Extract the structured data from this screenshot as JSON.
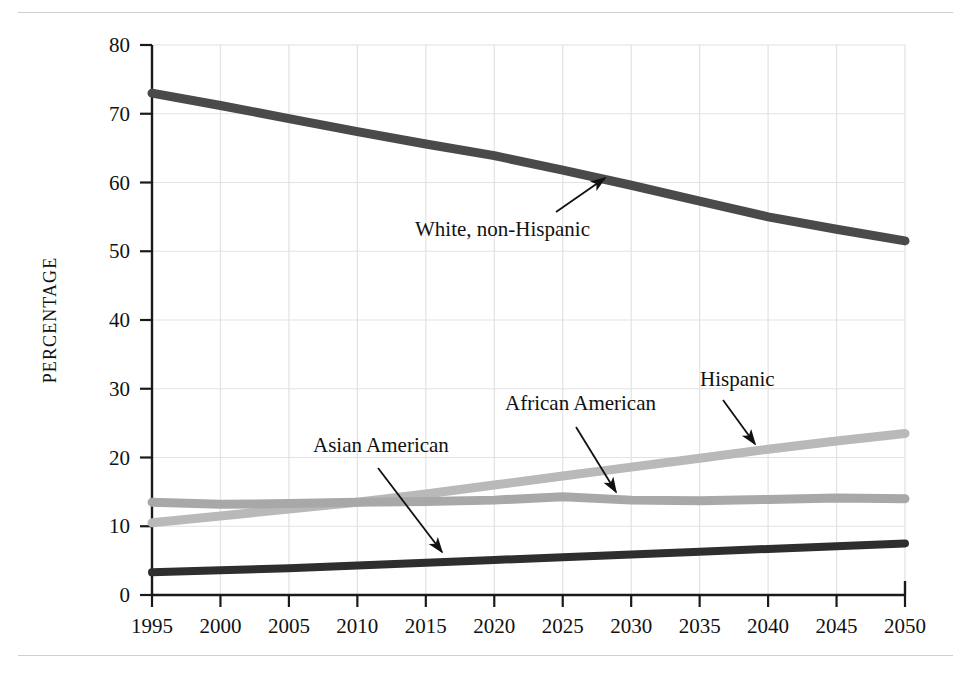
{
  "figure": {
    "top_rule": "horizontal-rule",
    "bottom_rule": "horizontal-rule"
  },
  "axes": {
    "y_title": "PERCENTAGE",
    "y_ticks": [
      "0",
      "10",
      "20",
      "30",
      "40",
      "50",
      "60",
      "70",
      "80"
    ],
    "x_ticks": [
      "1995",
      "2000",
      "2005",
      "2010",
      "2015",
      "2020",
      "2025",
      "2030",
      "2035",
      "2040",
      "2045",
      "2050"
    ]
  },
  "colors": {
    "white_non_hispanic": "#4a4a4a",
    "hispanic": "#b9b9b9",
    "african_american": "#a8a8a8",
    "asian_american": "#2e2e2e",
    "grid": "#e2e2e2",
    "axis": "#1a1a1a",
    "rule": "#cfcfcf",
    "text": "#111111"
  },
  "annotations": [
    {
      "id": "white-non-hispanic",
      "label": "White, non-Hispanic",
      "text_x": 415,
      "text_y": 236,
      "arrow_from_x": 556,
      "arrow_from_y": 212,
      "arrow_to_x": 605,
      "arrow_to_y": 178
    },
    {
      "id": "asian-american",
      "label": "Asian American",
      "text_x": 313,
      "text_y": 452,
      "arrow_from_x": 378,
      "arrow_from_y": 468,
      "arrow_to_x": 442,
      "arrow_to_y": 552
    },
    {
      "id": "african-american",
      "label": "African American",
      "text_x": 505,
      "text_y": 410,
      "arrow_from_x": 576,
      "arrow_from_y": 427,
      "arrow_to_x": 616,
      "arrow_to_y": 492
    },
    {
      "id": "hispanic",
      "label": "Hispanic",
      "text_x": 700,
      "text_y": 386,
      "arrow_from_x": 723,
      "arrow_from_y": 400,
      "arrow_to_x": 755,
      "arrow_to_y": 444
    }
  ],
  "chart_data": {
    "type": "line",
    "title": "",
    "xlabel": "",
    "ylabel": "PERCENTAGE",
    "xlim": [
      1995,
      2050
    ],
    "ylim": [
      0,
      80
    ],
    "grid": true,
    "legend": "inline-annotations",
    "x": [
      1995,
      2000,
      2005,
      2010,
      2015,
      2020,
      2025,
      2030,
      2035,
      2040,
      2045,
      2050
    ],
    "series": [
      {
        "name": "White, non-Hispanic",
        "color": "#4a4a4a",
        "width": 9,
        "values": [
          73.0,
          71.2,
          69.3,
          67.4,
          65.6,
          63.9,
          61.8,
          59.6,
          57.3,
          55.0,
          53.2,
          51.5
        ]
      },
      {
        "name": "Hispanic",
        "color": "#b9b9b9",
        "width": 9,
        "values": [
          10.5,
          11.5,
          12.5,
          13.5,
          14.7,
          16.0,
          17.3,
          18.6,
          19.9,
          21.2,
          22.4,
          23.5
        ]
      },
      {
        "name": "African American",
        "color": "#a8a8a8",
        "width": 9,
        "values": [
          13.5,
          13.2,
          13.3,
          13.5,
          13.6,
          13.8,
          14.3,
          13.8,
          13.7,
          13.9,
          14.1,
          14.0
        ]
      },
      {
        "name": "Asian American",
        "color": "#2e2e2e",
        "width": 8,
        "values": [
          3.3,
          3.6,
          3.9,
          4.3,
          4.7,
          5.1,
          5.5,
          5.9,
          6.3,
          6.7,
          7.1,
          7.5
        ]
      }
    ]
  }
}
